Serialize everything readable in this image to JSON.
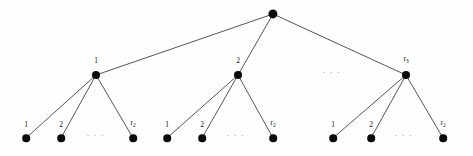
{
  "figure": {
    "width": 473,
    "height": 156,
    "background_color": "#fefefe",
    "node_color": "#0a0a0a",
    "edge_color": "#2b2b2b",
    "label_color": "#111111"
  },
  "chart_data": {
    "type": "diagram",
    "diagram_kind": "rooted-tree",
    "depth_levels": 3,
    "title": "",
    "nodes": [
      {
        "id": "root",
        "label": "",
        "label_sub": "",
        "x": 273,
        "y": 14,
        "r": 4.6,
        "level": 0
      },
      {
        "id": "l1n1",
        "label": "1",
        "label_sub": "",
        "x": 96,
        "y": 75,
        "r": 4.0,
        "level": 1
      },
      {
        "id": "l1n2",
        "label": "2",
        "label_sub": "",
        "x": 238,
        "y": 75,
        "r": 4.0,
        "level": 1
      },
      {
        "id": "l1n3",
        "label": "r",
        "label_sub": "3",
        "x": 406,
        "y": 75,
        "r": 4.0,
        "level": 1
      },
      {
        "id": "g1f1",
        "label": "1",
        "label_sub": "",
        "x": 26,
        "y": 138,
        "r": 3.8,
        "level": 2
      },
      {
        "id": "g1f2",
        "label": "2",
        "label_sub": "",
        "x": 61,
        "y": 138,
        "r": 3.8,
        "level": 2
      },
      {
        "id": "g1f3",
        "label": "r",
        "label_sub": "2",
        "x": 133,
        "y": 138,
        "r": 3.8,
        "level": 2
      },
      {
        "id": "g2f1",
        "label": "1",
        "label_sub": "",
        "x": 167,
        "y": 138,
        "r": 3.8,
        "level": 2
      },
      {
        "id": "g2f2",
        "label": "2",
        "label_sub": "",
        "x": 202,
        "y": 138,
        "r": 3.8,
        "level": 2
      },
      {
        "id": "g2f3",
        "label": "r",
        "label_sub": "2",
        "x": 273,
        "y": 138,
        "r": 3.8,
        "level": 2
      },
      {
        "id": "g3f1",
        "label": "1",
        "label_sub": "",
        "x": 333,
        "y": 138,
        "r": 3.8,
        "level": 2
      },
      {
        "id": "g3f2",
        "label": "2",
        "label_sub": "",
        "x": 371,
        "y": 138,
        "r": 3.8,
        "level": 2
      },
      {
        "id": "g3f3",
        "label": "r",
        "label_sub": "2",
        "x": 443,
        "y": 138,
        "r": 3.8,
        "level": 2
      }
    ],
    "edges": [
      {
        "from": "root",
        "to": "l1n1"
      },
      {
        "from": "root",
        "to": "l1n2"
      },
      {
        "from": "root",
        "to": "l1n3"
      },
      {
        "from": "l1n1",
        "to": "g1f1"
      },
      {
        "from": "l1n1",
        "to": "g1f2"
      },
      {
        "from": "l1n1",
        "to": "g1f3"
      },
      {
        "from": "l1n2",
        "to": "g2f1"
      },
      {
        "from": "l1n2",
        "to": "g2f2"
      },
      {
        "from": "l1n2",
        "to": "g2f3"
      },
      {
        "from": "l1n3",
        "to": "g3f1"
      },
      {
        "from": "l1n3",
        "to": "g3f2"
      },
      {
        "from": "l1n3",
        "to": "g3f3"
      }
    ],
    "ellipses": [
      {
        "id": "ell-level1",
        "text": "· · ·",
        "x": 332,
        "y": 73,
        "size": 7
      },
      {
        "id": "ell-group-1",
        "text": "· · ·",
        "x": 96,
        "y": 136,
        "size": 7
      },
      {
        "id": "ell-group-2",
        "text": "· · ·",
        "x": 236,
        "y": 136,
        "size": 7
      },
      {
        "id": "ell-group-3",
        "text": "· · ·",
        "x": 404,
        "y": 136,
        "size": 7
      }
    ],
    "label_offsets": {
      "level1_dy": -7,
      "leaf_dy": -6,
      "root_dy": -7
    },
    "label_font_size": 7.5
  }
}
